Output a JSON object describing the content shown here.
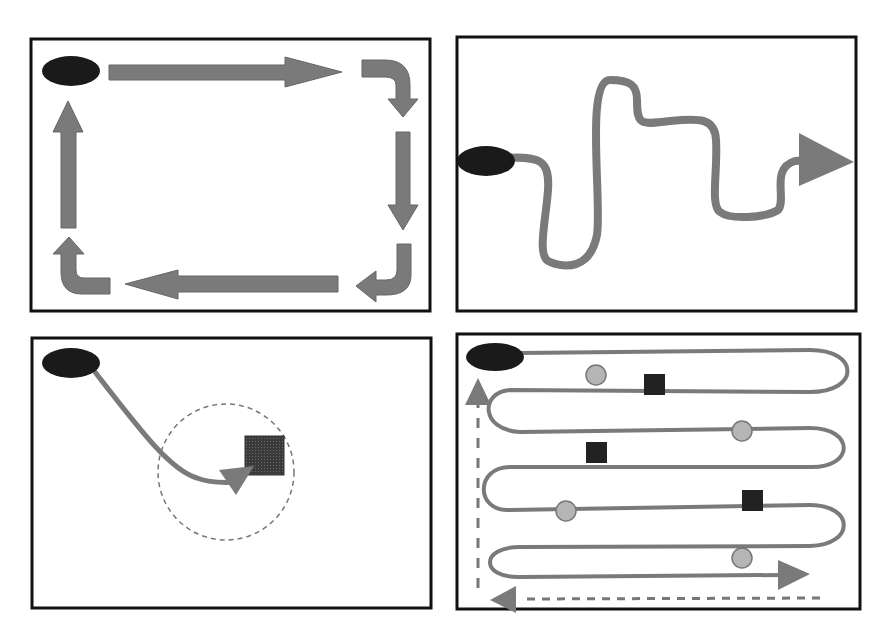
{
  "figure": {
    "colors": {
      "border": "#111111",
      "path": "#7a7a7a",
      "start": "#1a1a1a",
      "target_square": "#2a2a2a",
      "circle_fill": "#b5b5b5",
      "circle_stroke": "#777777",
      "dashed": "#777777"
    },
    "panels": [
      {
        "id": "perimeter",
        "name": "Perimeter search",
        "elements": [
          "start-oval",
          "right-arrow",
          "down-turn-arrow",
          "down-arrow",
          "left-turn-arrow",
          "left-arrow",
          "up-turn-arrow",
          "up-arrow"
        ]
      },
      {
        "id": "random",
        "name": "Random/meandering path",
        "elements": [
          "start-oval",
          "wavy-path",
          "arrowhead"
        ]
      },
      {
        "id": "targeted",
        "name": "Direct approach to target",
        "elements": [
          "start-oval",
          "curved-path",
          "arrowhead",
          "target-square",
          "dashed-circle"
        ]
      },
      {
        "id": "serpentine",
        "name": "Serpentine sweep",
        "elements": [
          "start-oval",
          "serpentine-path",
          "circles",
          "squares",
          "return-dashed-arrow"
        ]
      }
    ]
  }
}
